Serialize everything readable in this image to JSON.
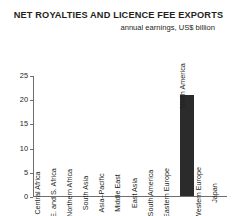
{
  "chart_data": {
    "type": "bar",
    "title": "NET ROYALTIES AND LICENCE FEE EXPORTS",
    "subtitle": "annual earnings, US$ billion",
    "xlabel": "",
    "ylabel": "",
    "ylim": [
      0,
      25
    ],
    "yticks": [
      0,
      5,
      10,
      15,
      20,
      25
    ],
    "ytick_labels": [
      "0",
      "5",
      "10",
      "15",
      "20",
      "25"
    ],
    "grid": false,
    "legend": "none",
    "bar_color": "#2b2b2b",
    "axis_color": "#6d6e70",
    "categories": [
      "Central Africa",
      "E. and S. Africa",
      "Northern Africa",
      "South Asia",
      "Asia–Pacific",
      "Middle East",
      "East Asia",
      "South America",
      "Eastern Europe",
      "North America",
      "Western Europe",
      "Japan"
    ],
    "values": [
      0,
      0,
      0,
      0,
      0,
      0,
      0,
      0,
      0,
      21,
      0,
      0
    ]
  }
}
